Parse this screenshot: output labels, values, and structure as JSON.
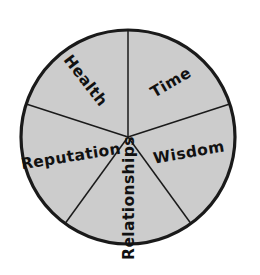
{
  "figure": {
    "kind": "pie-wheel-diagram"
  },
  "style": {
    "sector_fill": "#cccccc",
    "outline_color": "#1a1a1a",
    "spoke_color": "#1a1a1a",
    "background": "#ffffff",
    "label_color": "#111111",
    "outline_width": 3.2,
    "spoke_width": 1.5
  },
  "geometry": {
    "center_x": 128,
    "center_y": 137,
    "radius": 107,
    "sector_count": 5,
    "sector_angle_deg": 72
  },
  "chart_data": {
    "type": "pie",
    "title": "",
    "categories": [
      "Time",
      "Wisdom",
      "Relationships",
      "Reputation",
      "Health"
    ],
    "values": [
      20,
      20,
      20,
      20,
      20
    ],
    "legend": "none",
    "labels_inside": true
  },
  "sectors": [
    {
      "id": "time",
      "label": "Time",
      "start_angle_deg": 18,
      "end_angle_deg": 90,
      "label_x": 171,
      "label_y": 83,
      "label_rotation_deg": -30,
      "font_size": 15.5
    },
    {
      "id": "wisdom",
      "label": "Wisdom",
      "start_angle_deg": -54,
      "end_angle_deg": 18,
      "label_x": 189,
      "label_y": 153,
      "label_rotation_deg": -10,
      "font_size": 15.5
    },
    {
      "id": "relationships",
      "label": "Relationships",
      "start_angle_deg": -126,
      "end_angle_deg": -54,
      "label_x": 129,
      "label_y": 198,
      "label_rotation_deg": -90,
      "font_size": 15.5
    },
    {
      "id": "reputation",
      "label": "Reputation",
      "start_angle_deg": 162,
      "end_angle_deg": 234,
      "label_x": 71,
      "label_y": 157,
      "label_rotation_deg": -9,
      "font_size": 15.5
    },
    {
      "id": "health",
      "label": "Health",
      "start_angle_deg": 90,
      "end_angle_deg": 162,
      "label_x": 85,
      "label_y": 81,
      "label_rotation_deg": 52,
      "font_size": 15.5
    }
  ]
}
